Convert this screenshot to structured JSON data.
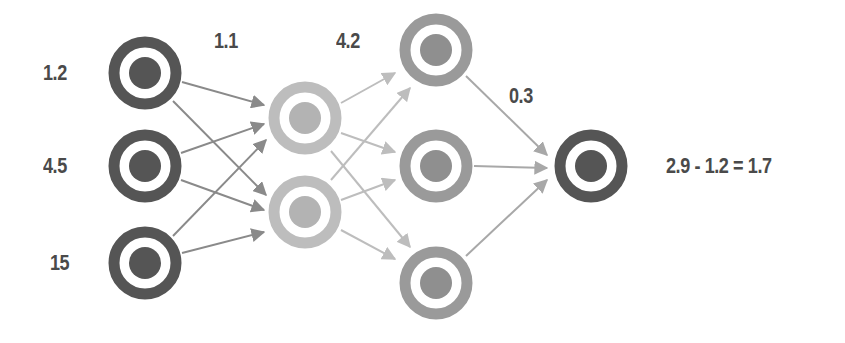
{
  "diagram": {
    "title": "",
    "type": "neural-network",
    "colors": {
      "input_node": "#555555",
      "hidden1_node": "#bdbdbd",
      "hidden2_node": "#9a9a9a",
      "output_node": "#555555",
      "edge_dark": "#8a8a8a",
      "edge_light": "#bdbdbd",
      "label": "#4a4a4a",
      "background": "#ffffff"
    },
    "layers": [
      {
        "name": "input",
        "nodes": [
          {
            "id": "in1",
            "cx": 145,
            "cy": 73,
            "value_label": "1.2"
          },
          {
            "id": "in2",
            "cx": 145,
            "cy": 166,
            "value_label": "4.5"
          },
          {
            "id": "in3",
            "cx": 145,
            "cy": 263,
            "value_label": "15"
          }
        ]
      },
      {
        "name": "hidden1",
        "nodes": [
          {
            "id": "h1a",
            "cx": 305,
            "cy": 118
          },
          {
            "id": "h1b",
            "cx": 305,
            "cy": 212
          }
        ]
      },
      {
        "name": "hidden2",
        "nodes": [
          {
            "id": "h2a",
            "cx": 436,
            "cy": 50
          },
          {
            "id": "h2b",
            "cx": 436,
            "cy": 166
          },
          {
            "id": "h2c",
            "cx": 436,
            "cy": 283
          }
        ]
      },
      {
        "name": "output",
        "nodes": [
          {
            "id": "out",
            "cx": 591,
            "cy": 166
          }
        ]
      }
    ],
    "labels": {
      "input_1": "1.2",
      "input_2": "4.5",
      "input_3": "15",
      "weight_1": "1.1",
      "weight_2": "4.2",
      "weight_3": "0.3",
      "output_equation": "2.9 - 1.2 = 1.7"
    }
  }
}
